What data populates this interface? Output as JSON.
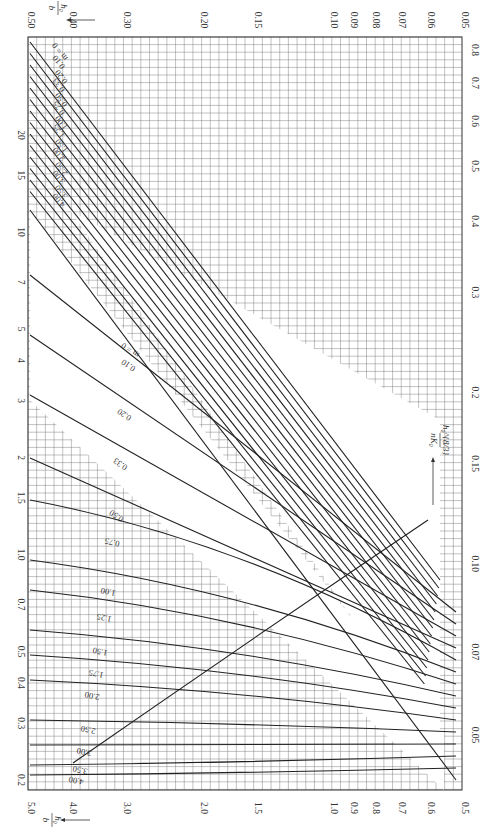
{
  "chart_data": {
    "type": "line",
    "title": "",
    "orientation": "rotated 90° (page printed sideways)",
    "grid": true,
    "axes": {
      "left_edge": {
        "label": "",
        "scale": "log",
        "ticks": [
          "20",
          "15",
          "10",
          "7",
          "5",
          "4",
          "3",
          "2",
          "1.5",
          "1.0",
          "0.7",
          "0.5",
          "0.4",
          "0.3",
          "0.2"
        ],
        "tick_values": [
          20,
          15,
          10,
          7,
          5,
          4,
          3,
          2,
          1.5,
          1.0,
          0.7,
          0.5,
          0.4,
          0.3,
          0.2
        ]
      },
      "right_edge": {
        "label": "h0^(8/3) / (n K0)",
        "scale": "log",
        "ticks": [
          "0.8",
          "0.7",
          "0.6",
          "0.5",
          "0.4",
          "0.3",
          "0.2",
          "0.15",
          "0.10",
          "0.07",
          "0.05"
        ],
        "tick_values": [
          0.8,
          0.7,
          0.6,
          0.5,
          0.4,
          0.3,
          0.2,
          0.15,
          0.1,
          0.07,
          0.05
        ]
      },
      "top_edge": {
        "label": "h0 / b",
        "scale": "log",
        "ticks": [
          "0.50",
          "0.40",
          "0.30",
          "0.20",
          "0.15",
          "0.10",
          "0.09",
          "0.08",
          "0.07",
          "0.06",
          "0.05"
        ],
        "tick_values": [
          0.5,
          0.4,
          0.3,
          0.2,
          0.15,
          0.1,
          0.09,
          0.08,
          0.07,
          0.06,
          0.05
        ]
      },
      "bottom_edge": {
        "label": "h0 / b",
        "scale": "log",
        "ticks": [
          "5.0",
          "4.0",
          "3.0",
          "2.0",
          "1.5",
          "1.0",
          "0.9",
          "0.8",
          "0.7",
          "0.6",
          "0.5"
        ],
        "tick_values": [
          5.0,
          4.0,
          3.0,
          2.0,
          1.5,
          1.0,
          0.9,
          0.8,
          0.7,
          0.6,
          0.5
        ]
      }
    },
    "series_groups": [
      {
        "name": "upper family (h0/b 0.05–0.50)",
        "parameter": "m",
        "series": [
          {
            "name": "m = 0",
            "label": "m = 0"
          },
          {
            "name": "0.10",
            "label": "0.10"
          },
          {
            "name": "0.20",
            "label": "0.20"
          },
          {
            "name": "0.33",
            "label": "0.33"
          },
          {
            "name": "0.50",
            "label": "0.50"
          },
          {
            "name": "0.75",
            "label": "0.75"
          },
          {
            "name": "1.00",
            "label": "1.00"
          },
          {
            "name": "1.25",
            "label": "1.25"
          },
          {
            "name": "1.50",
            "label": "1.50"
          },
          {
            "name": "2.00",
            "label": "2.00"
          },
          {
            "name": "2.50",
            "label": "2.50"
          },
          {
            "name": "3.00",
            "label": "3.00"
          },
          {
            "name": "3.50",
            "label": "3.50"
          },
          {
            "name": "4.00",
            "label": "4.00"
          }
        ]
      },
      {
        "name": "lower family (h0/b 0.5–5.0)",
        "parameter": "m",
        "series": [
          {
            "name": "m = 0",
            "label": "m = 0"
          },
          {
            "name": "0.10",
            "label": "0.10"
          },
          {
            "name": "0.20",
            "label": "0.20"
          },
          {
            "name": "0.33",
            "label": "0.33"
          },
          {
            "name": "0.50",
            "label": "0.50"
          },
          {
            "name": "0.75",
            "label": "0.75"
          },
          {
            "name": "1.00",
            "label": "1.00"
          },
          {
            "name": "1.25",
            "label": "1.25"
          },
          {
            "name": "1.50",
            "label": "1.50"
          },
          {
            "name": "1.75",
            "label": "1.75"
          },
          {
            "name": "2.00",
            "label": "2.00"
          },
          {
            "name": "2.50",
            "label": "2.50"
          },
          {
            "name": "3.00",
            "label": "3.00"
          },
          {
            "name": "3.50",
            "label": "3.50"
          },
          {
            "name": "4.00",
            "label": "4.00"
          }
        ]
      }
    ],
    "annotations": [
      "h0/b ←",
      "h0/b ←",
      "h0^(8/3)/(nK0) →"
    ]
  },
  "labels": {
    "top_axis_title_num": "h₀",
    "top_axis_title_den": "b",
    "bottom_axis_title_num": "h₀",
    "bottom_axis_title_den": "b",
    "right_title_num": "h₀^{8/3}",
    "right_title_den": "nK₀"
  }
}
